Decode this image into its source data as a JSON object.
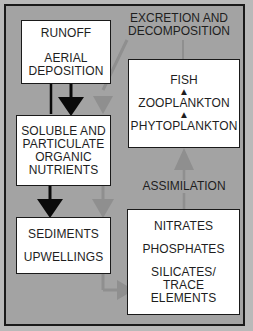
{
  "diagram": {
    "title_label": {
      "line1": "EXCRETION AND",
      "line2": "DECOMPOSITION"
    },
    "assimilation_label": "ASSIMILATION",
    "boxes": {
      "sources": {
        "line1": "RUNOFF",
        "line2": "AERIAL",
        "line3": "DEPOSITION"
      },
      "organic": {
        "line1": "SOLUBLE AND",
        "line2": "PARTICULATE",
        "line3": "ORGANIC",
        "line4": "NUTRIENTS"
      },
      "sediments": {
        "line1": "SEDIMENTS",
        "line2": "UPWELLINGS"
      },
      "food_chain": {
        "top": "FISH",
        "middle": "ZOOPLANKTON",
        "bottom": "PHYTOPLANKTON"
      },
      "inorganic": {
        "line1": "NITRATES",
        "line2": "PHOSPHATES",
        "line3": "SILICATES/",
        "line4": "TRACE",
        "line5": "ELEMENTS"
      }
    },
    "colors": {
      "background": "#a3a3a3",
      "box_fill": "#ffffff",
      "black_arrow": "#0a0a0a",
      "gray_arrow": "#8f8f8f"
    }
  }
}
